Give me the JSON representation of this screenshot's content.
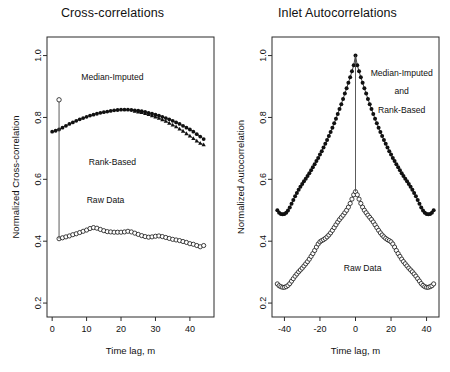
{
  "figure": {
    "width": 450,
    "height": 372,
    "background": "#ffffff",
    "ink_color": "#111111"
  },
  "chart_data": [
    {
      "id": "cross-correlations",
      "type": "line",
      "title": "Cross-correlations",
      "xlabel": "Time lag, m",
      "ylabel": "Normalized Cross-correlation",
      "xlim": [
        -1.5,
        47
      ],
      "ylim": [
        0.155,
        1.06
      ],
      "xticks": [
        0,
        10,
        20,
        30,
        40
      ],
      "xticklabels": [
        "0",
        "10",
        "20",
        "30",
        "40"
      ],
      "yticks": [
        0.2,
        0.4,
        0.6,
        0.8,
        1.0
      ],
      "yticklabels": [
        "0.2",
        "0.4",
        "0.6",
        "0.8",
        "1.0"
      ],
      "grid": false,
      "legend": "in-plot annotations",
      "annotations": [
        {
          "text": "Median-Imputed",
          "x": 17.5,
          "y": 0.92
        },
        {
          "text": "Rank-Based",
          "x": 17.5,
          "y": 0.645
        },
        {
          "text": "Raw Data",
          "x": 15.5,
          "y": 0.525
        }
      ],
      "series": [
        {
          "name": "Median-Imputed and Rank-Based",
          "marker": "filled-circle",
          "marker_size": 1.9,
          "x": [
            0,
            1,
            2,
            3,
            4,
            5,
            6,
            7,
            8,
            9,
            10,
            11,
            12,
            13,
            14,
            15,
            16,
            17,
            18,
            19,
            20,
            21,
            22,
            23,
            24,
            25,
            26,
            27,
            28,
            29,
            30,
            31,
            32,
            33,
            34,
            35,
            36,
            37,
            38,
            39,
            40,
            41,
            42,
            43,
            44
          ],
          "values": [
            0.754,
            0.757,
            0.761,
            0.767,
            0.773,
            0.779,
            0.784,
            0.789,
            0.794,
            0.798,
            0.802,
            0.806,
            0.809,
            0.812,
            0.815,
            0.817,
            0.819,
            0.821,
            0.823,
            0.824,
            0.825,
            0.825,
            0.825,
            0.824,
            0.823,
            0.822,
            0.82,
            0.818,
            0.815,
            0.812,
            0.809,
            0.806,
            0.802,
            0.798,
            0.794,
            0.789,
            0.784,
            0.779,
            0.773,
            0.767,
            0.761,
            0.754,
            0.746,
            0.738,
            0.73
          ]
        },
        {
          "name": "Median-Imputed and Rank-Based (lower branch)",
          "marker": "filled-triangle",
          "marker_size": 1.9,
          "x": [
            24,
            25,
            26,
            27,
            28,
            29,
            30,
            31,
            32,
            33,
            34,
            35,
            36,
            37,
            38,
            39,
            40,
            41,
            42,
            43,
            44
          ],
          "values": [
            0.82,
            0.818,
            0.816,
            0.813,
            0.81,
            0.806,
            0.802,
            0.798,
            0.793,
            0.788,
            0.782,
            0.776,
            0.77,
            0.763,
            0.756,
            0.748,
            0.74,
            0.732,
            0.724,
            0.717,
            0.712
          ]
        },
        {
          "name": "Raw Data",
          "marker": "open-circle",
          "marker_size": 2.1,
          "x": [
            2,
            3,
            4,
            5,
            6,
            7,
            8,
            9,
            10,
            11,
            12,
            13,
            14,
            15,
            16,
            17,
            18,
            19,
            20,
            21,
            22,
            23,
            24,
            25,
            26,
            27,
            28,
            29,
            30,
            31,
            32,
            33,
            34,
            35,
            36,
            37,
            38,
            39,
            40,
            41,
            42,
            43,
            44
          ],
          "values": [
            0.408,
            0.411,
            0.414,
            0.417,
            0.421,
            0.424,
            0.428,
            0.432,
            0.436,
            0.441,
            0.444,
            0.442,
            0.438,
            0.434,
            0.431,
            0.43,
            0.429,
            0.429,
            0.429,
            0.43,
            0.432,
            0.43,
            0.426,
            0.422,
            0.418,
            0.415,
            0.413,
            0.414,
            0.416,
            0.417,
            0.415,
            0.412,
            0.409,
            0.406,
            0.404,
            0.402,
            0.399,
            0.396,
            0.392,
            0.39,
            0.386,
            0.382,
            0.386
          ]
        },
        {
          "name": "Raw Data lag-2 spike",
          "marker": "open-circle",
          "marker_size": 2.2,
          "x": [
            2
          ],
          "values": [
            0.857
          ],
          "droplines": [
            {
              "x": 2,
              "y_top": 0.857,
              "y_bottom": 0.408
            }
          ]
        }
      ]
    },
    {
      "id": "inlet-autocorrelations",
      "type": "line",
      "title": "Inlet Autocorrelations",
      "xlabel": "Time lag, m",
      "ylabel": "Normalized Autocorrelation",
      "xlim": [
        -47,
        47
      ],
      "ylim": [
        0.155,
        1.06
      ],
      "xticks": [
        -40,
        -20,
        0,
        20,
        40
      ],
      "xticklabels": [
        "-40",
        "-20",
        "0",
        "20",
        "40"
      ],
      "yticks": [
        0.2,
        0.4,
        0.6,
        0.8,
        1.0
      ],
      "yticklabels": [
        "0.2",
        "0.4",
        "0.6",
        "0.8",
        "1.0"
      ],
      "grid": false,
      "legend": "in-plot annotations",
      "annotations": [
        {
          "text": "Median-Imputed",
          "x": 26,
          "y": 0.935
        },
        {
          "text": "and",
          "x": 26,
          "y": 0.875
        },
        {
          "text": "Rank-Based",
          "x": 26,
          "y": 0.815
        },
        {
          "text": "Raw Data",
          "x": 4,
          "y": 0.305
        }
      ],
      "series": [
        {
          "name": "Median-Imputed and Rank-Based",
          "marker": "filled-circle",
          "marker_size": 2.0,
          "x": [
            -44,
            -43,
            -42,
            -41,
            -40,
            -39,
            -38,
            -37,
            -36,
            -35,
            -34,
            -33,
            -32,
            -31,
            -30,
            -29,
            -28,
            -27,
            -26,
            -25,
            -24,
            -23,
            -22,
            -21,
            -20,
            -19,
            -18,
            -17,
            -16,
            -15,
            -14,
            -13,
            -12,
            -11,
            -10,
            -9,
            -8,
            -7,
            -6,
            -5,
            -4,
            -3,
            -2,
            -1,
            0,
            1,
            2,
            3,
            4,
            5,
            6,
            7,
            8,
            9,
            10,
            11,
            12,
            13,
            14,
            15,
            16,
            17,
            18,
            19,
            20,
            21,
            22,
            23,
            24,
            25,
            26,
            27,
            28,
            29,
            30,
            31,
            32,
            33,
            34,
            35,
            36,
            37,
            38,
            39,
            40,
            41,
            42,
            43,
            44
          ],
          "values": [
            0.5,
            0.492,
            0.488,
            0.487,
            0.488,
            0.492,
            0.499,
            0.509,
            0.521,
            0.533,
            0.545,
            0.556,
            0.566,
            0.576,
            0.585,
            0.594,
            0.602,
            0.611,
            0.62,
            0.629,
            0.639,
            0.649,
            0.659,
            0.669,
            0.68,
            0.691,
            0.703,
            0.715,
            0.727,
            0.74,
            0.753,
            0.767,
            0.781,
            0.796,
            0.811,
            0.827,
            0.843,
            0.86,
            0.877,
            0.894,
            0.912,
            0.93,
            0.949,
            0.969,
            1.0,
            0.969,
            0.949,
            0.93,
            0.912,
            0.894,
            0.877,
            0.86,
            0.843,
            0.827,
            0.811,
            0.796,
            0.781,
            0.767,
            0.753,
            0.74,
            0.727,
            0.715,
            0.703,
            0.691,
            0.68,
            0.669,
            0.659,
            0.649,
            0.639,
            0.629,
            0.62,
            0.611,
            0.602,
            0.594,
            0.585,
            0.576,
            0.566,
            0.556,
            0.545,
            0.533,
            0.521,
            0.509,
            0.499,
            0.492,
            0.488,
            0.487,
            0.488,
            0.492,
            0.5
          ]
        },
        {
          "name": "Raw Data",
          "marker": "open-circle",
          "marker_size": 2.1,
          "x": [
            -44,
            -43,
            -42,
            -41,
            -40,
            -39,
            -38,
            -37,
            -36,
            -35,
            -34,
            -33,
            -32,
            -31,
            -30,
            -29,
            -28,
            -27,
            -26,
            -25,
            -24,
            -23,
            -22,
            -21,
            -20,
            -19,
            -18,
            -17,
            -16,
            -15,
            -14,
            -13,
            -12,
            -11,
            -10,
            -9,
            -8,
            -7,
            -6,
            -5,
            -4,
            -3,
            -2,
            -1,
            0,
            1,
            2,
            3,
            4,
            5,
            6,
            7,
            8,
            9,
            10,
            11,
            12,
            13,
            14,
            15,
            16,
            17,
            18,
            19,
            20,
            21,
            22,
            23,
            24,
            25,
            26,
            27,
            28,
            29,
            30,
            31,
            32,
            33,
            34,
            35,
            36,
            37,
            38,
            39,
            40,
            41,
            42,
            43,
            44
          ],
          "values": [
            0.262,
            0.256,
            0.253,
            0.251,
            0.251,
            0.253,
            0.257,
            0.263,
            0.271,
            0.279,
            0.287,
            0.294,
            0.301,
            0.307,
            0.313,
            0.32,
            0.327,
            0.334,
            0.342,
            0.351,
            0.36,
            0.37,
            0.381,
            0.391,
            0.398,
            0.402,
            0.405,
            0.409,
            0.414,
            0.42,
            0.427,
            0.435,
            0.444,
            0.453,
            0.462,
            0.47,
            0.477,
            0.484,
            0.492,
            0.5,
            0.51,
            0.522,
            0.536,
            0.55,
            0.56,
            0.55,
            0.536,
            0.522,
            0.51,
            0.5,
            0.492,
            0.484,
            0.477,
            0.47,
            0.462,
            0.453,
            0.444,
            0.435,
            0.427,
            0.42,
            0.414,
            0.409,
            0.405,
            0.402,
            0.398,
            0.391,
            0.381,
            0.37,
            0.36,
            0.351,
            0.342,
            0.334,
            0.327,
            0.32,
            0.313,
            0.307,
            0.301,
            0.294,
            0.287,
            0.279,
            0.271,
            0.263,
            0.257,
            0.253,
            0.251,
            0.251,
            0.253,
            0.256,
            0.262
          ]
        },
        {
          "name": "Center vertical connector",
          "marker": "none",
          "droplines": [
            {
              "x": 0,
              "y_top": 1.0,
              "y_bottom": 0.56
            }
          ]
        }
      ]
    }
  ]
}
